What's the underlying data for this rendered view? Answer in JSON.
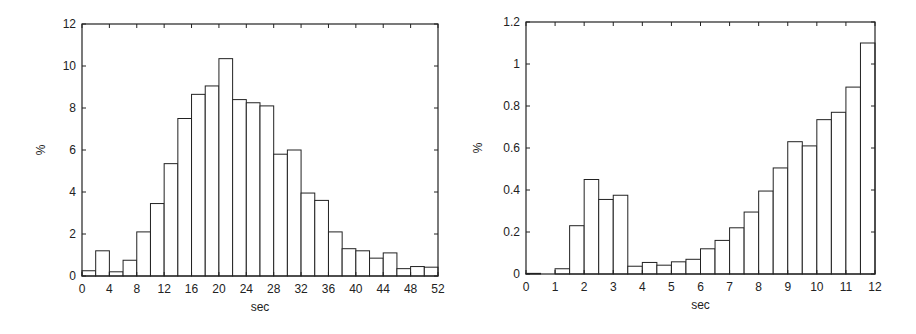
{
  "chart_data": [
    {
      "type": "bar",
      "title": "",
      "xlabel": "sec",
      "ylabel": "%",
      "xlim": [
        0,
        52
      ],
      "ylim": [
        0,
        12
      ],
      "bin_width": 2,
      "xticks": [
        0,
        4,
        8,
        12,
        16,
        20,
        24,
        28,
        32,
        36,
        40,
        44,
        48,
        52
      ],
      "yticks": [
        0,
        2,
        4,
        6,
        8,
        10,
        12
      ],
      "bin_starts": [
        0,
        2,
        4,
        6,
        8,
        10,
        12,
        14,
        16,
        18,
        20,
        22,
        24,
        26,
        28,
        30,
        32,
        34,
        36,
        38,
        40,
        42,
        44,
        46,
        48,
        50
      ],
      "values": [
        0.25,
        1.2,
        0.2,
        0.75,
        2.1,
        3.45,
        5.35,
        7.5,
        8.65,
        9.05,
        10.35,
        8.4,
        8.25,
        8.1,
        5.8,
        6.0,
        3.95,
        3.6,
        2.1,
        1.3,
        1.2,
        0.85,
        1.1,
        0.35,
        0.45,
        0.42
      ],
      "grid": false,
      "legend": null
    },
    {
      "type": "bar",
      "title": "",
      "xlabel": "sec",
      "ylabel": "%",
      "xlim": [
        0,
        12
      ],
      "ylim": [
        0,
        1.2
      ],
      "bin_width": 0.5,
      "xticks": [
        0,
        1,
        2,
        3,
        4,
        5,
        6,
        7,
        8,
        9,
        10,
        11,
        12
      ],
      "yticks": [
        0,
        0.2,
        0.4,
        0.6,
        0.8,
        1,
        1.2
      ],
      "ytick_labels": [
        "0",
        "0.2",
        "0.4",
        "0.6",
        "0.8",
        "1",
        "1.2"
      ],
      "bin_starts": [
        0,
        0.5,
        1,
        1.5,
        2,
        2.5,
        3,
        3.5,
        4,
        4.5,
        5,
        5.5,
        6,
        6.5,
        7,
        7.5,
        8,
        8.5,
        9,
        9.5,
        10,
        10.5,
        11,
        11.5
      ],
      "values": [
        0.003,
        0,
        0.025,
        0.23,
        0.45,
        0.355,
        0.375,
        0.037,
        0.055,
        0.042,
        0.058,
        0.07,
        0.12,
        0.16,
        0.22,
        0.295,
        0.395,
        0.505,
        0.63,
        0.61,
        0.735,
        0.77,
        0.89,
        1.1
      ],
      "grid": false,
      "legend": null
    }
  ],
  "charts": [
    {
      "xlabel": "sec",
      "ylabel": "%"
    },
    {
      "xlabel": "sec",
      "ylabel": "%"
    }
  ]
}
